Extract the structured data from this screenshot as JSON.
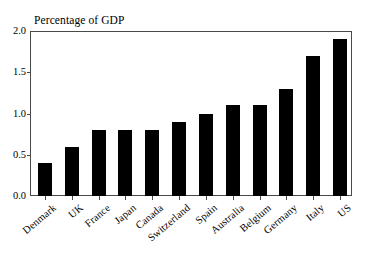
{
  "chart_data": {
    "type": "bar",
    "title": "Percentage of GDP",
    "xlabel": "",
    "ylabel": "",
    "ylim": [
      0.0,
      2.0
    ],
    "yticks": [
      "0.0",
      "0.5",
      "1.0",
      "1.5",
      "2.0"
    ],
    "grid": false,
    "legend": "none",
    "bar_color": "#000000",
    "frame_color": "#4a4a4a",
    "categories": [
      "Denmark",
      "UK",
      "France",
      "Japan",
      "Canada",
      "Switzerland",
      "Spain",
      "Australia",
      "Belgium",
      "Germany",
      "Italy",
      "US"
    ],
    "values": [
      0.4,
      0.6,
      0.8,
      0.8,
      0.8,
      0.9,
      1.0,
      1.1,
      1.1,
      1.3,
      1.7,
      1.9
    ]
  }
}
